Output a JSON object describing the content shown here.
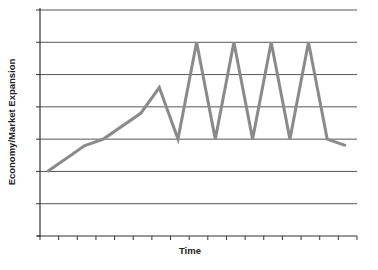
{
  "chart_data": {
    "type": "line",
    "title": "",
    "xlabel": "Time",
    "ylabel": "Economy/Market Expansion",
    "x_ticks_count": 18,
    "y_gridlines": [
      1,
      2,
      3,
      4,
      5,
      6,
      7
    ],
    "ylim": [
      0,
      7
    ],
    "xlim": [
      0,
      17
    ],
    "grid": "horizontal",
    "legend": null,
    "series": [
      {
        "name": "Economy/Market Expansion",
        "color": "#8a8a8a",
        "x": [
          0.4,
          2.4,
          3.4,
          5.4,
          6.4,
          7.4,
          8.4,
          9.4,
          10.4,
          11.4,
          12.4,
          13.4,
          14.4,
          15.4,
          16.4
        ],
        "values": [
          2.0,
          2.8,
          3.0,
          3.8,
          4.6,
          3.0,
          6.0,
          3.0,
          6.0,
          3.0,
          6.0,
          3.0,
          6.0,
          3.0,
          2.8
        ]
      }
    ]
  },
  "labels": {
    "x": "Time",
    "y": "Economy/Market Expansion"
  },
  "colors": {
    "line": "#8a8a8a",
    "grid": "#555555",
    "axis": "#333333"
  }
}
